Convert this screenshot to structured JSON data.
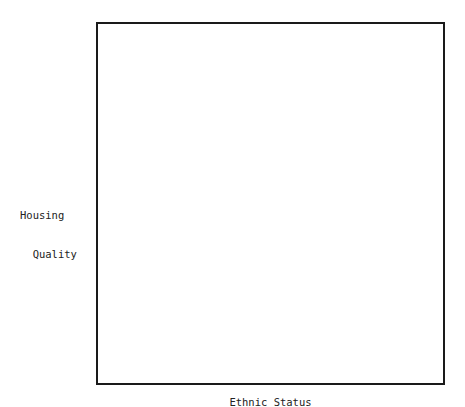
{
  "chart_data": {
    "type": "scatter",
    "title": "",
    "xlabel": "Ethnic Status",
    "ylabel": "Housing Quality",
    "ylabel_lines": [
      "Housing",
      "  Quality"
    ],
    "grid": false,
    "legend": null,
    "axis_ticks": false,
    "coordinate_space": "pixels relative to plot frame top-left (frame 349x363)",
    "points": [
      [
        36,
        29
      ],
      [
        43,
        40
      ],
      [
        79,
        40
      ],
      [
        57,
        53
      ],
      [
        102,
        53
      ],
      [
        101,
        59
      ],
      [
        143,
        55
      ],
      [
        181,
        46
      ],
      [
        225,
        49
      ],
      [
        208,
        53
      ],
      [
        258,
        41
      ],
      [
        290,
        45
      ],
      [
        292,
        44
      ],
      [
        325,
        52
      ],
      [
        305,
        56
      ],
      [
        339,
        43
      ],
      [
        321,
        71
      ],
      [
        282,
        71
      ],
      [
        225,
        71
      ],
      [
        190,
        82
      ],
      [
        167,
        63
      ],
      [
        156,
        74
      ],
      [
        148,
        85
      ],
      [
        119,
        66
      ],
      [
        127,
        80
      ],
      [
        101,
        88
      ],
      [
        62,
        71
      ],
      [
        51,
        88
      ],
      [
        34,
        89
      ],
      [
        70,
        82
      ],
      [
        71,
        90
      ],
      [
        86,
        96
      ],
      [
        100,
        88
      ],
      [
        99,
        102
      ],
      [
        115,
        90
      ],
      [
        132,
        120
      ],
      [
        158,
        93
      ],
      [
        174,
        89
      ],
      [
        178,
        88
      ],
      [
        185,
        81
      ],
      [
        200,
        88
      ],
      [
        211,
        86
      ],
      [
        198,
        106
      ],
      [
        186,
        103
      ],
      [
        187,
        114
      ],
      [
        203,
        116
      ],
      [
        198,
        122
      ],
      [
        185,
        96
      ],
      [
        191,
        105
      ],
      [
        176,
        115
      ],
      [
        180,
        128
      ],
      [
        233,
        108
      ],
      [
        235,
        121
      ],
      [
        231,
        117
      ],
      [
        248,
        122
      ],
      [
        243,
        103
      ],
      [
        298,
        99
      ],
      [
        304,
        96
      ],
      [
        300,
        102
      ],
      [
        282,
        132
      ],
      [
        270,
        142
      ],
      [
        267,
        103
      ],
      [
        282,
        113
      ],
      [
        281,
        126
      ],
      [
        216,
        142
      ],
      [
        232,
        146
      ],
      [
        241,
        144
      ],
      [
        205,
        149
      ],
      [
        152,
        134
      ],
      [
        142,
        116
      ],
      [
        131,
        104
      ],
      [
        135,
        142
      ],
      [
        105,
        133
      ],
      [
        125,
        123
      ],
      [
        99,
        141
      ],
      [
        124,
        147
      ],
      [
        101,
        158
      ],
      [
        117,
        165
      ],
      [
        119,
        172
      ],
      [
        116,
        169
      ],
      [
        92,
        173
      ],
      [
        99,
        169
      ],
      [
        89,
        181
      ],
      [
        110,
        180
      ],
      [
        120,
        182
      ],
      [
        133,
        188
      ],
      [
        131,
        188
      ],
      [
        136,
        192
      ],
      [
        157,
        213
      ],
      [
        151,
        196
      ],
      [
        154,
        212
      ],
      [
        134,
        203
      ],
      [
        155,
        223
      ],
      [
        124,
        222
      ],
      [
        106,
        220
      ],
      [
        107,
        225
      ],
      [
        111,
        226
      ],
      [
        93,
        232
      ],
      [
        95,
        245
      ],
      [
        90,
        244
      ],
      [
        79,
        232
      ],
      [
        67,
        224
      ],
      [
        47,
        231
      ],
      [
        43,
        207
      ],
      [
        54,
        212
      ],
      [
        58,
        224
      ],
      [
        55,
        199
      ],
      [
        40,
        196
      ],
      [
        24,
        215
      ],
      [
        29,
        239
      ],
      [
        42,
        251
      ],
      [
        37,
        248
      ],
      [
        32,
        257
      ],
      [
        36,
        256
      ],
      [
        22,
        270
      ],
      [
        24,
        266
      ],
      [
        49,
        258
      ],
      [
        56,
        256
      ],
      [
        70,
        266
      ],
      [
        73,
        278
      ],
      [
        68,
        285
      ],
      [
        69,
        292
      ],
      [
        64,
        295
      ],
      [
        59,
        302
      ],
      [
        51,
        311
      ],
      [
        24,
        318
      ],
      [
        23,
        330
      ],
      [
        19,
        306
      ],
      [
        27,
        320
      ],
      [
        25,
        334
      ],
      [
        45,
        319
      ],
      [
        43,
        324
      ],
      [
        26,
        339
      ],
      [
        32,
        342
      ],
      [
        42,
        341
      ],
      [
        54,
        337
      ],
      [
        68,
        333
      ],
      [
        90,
        337
      ],
      [
        101,
        323
      ],
      [
        116,
        318
      ],
      [
        124,
        318
      ],
      [
        128,
        322
      ],
      [
        150,
        303
      ],
      [
        124,
        305
      ],
      [
        137,
        313
      ],
      [
        176,
        311
      ],
      [
        168,
        318
      ],
      [
        207,
        320
      ],
      [
        176,
        333
      ],
      [
        198,
        341
      ],
      [
        192,
        343
      ],
      [
        189,
        338
      ],
      [
        224,
        327
      ],
      [
        248,
        324
      ],
      [
        263,
        334
      ],
      [
        259,
        330
      ],
      [
        265,
        330
      ],
      [
        277,
        322
      ],
      [
        277,
        334
      ],
      [
        270,
        349
      ],
      [
        282,
        336
      ],
      [
        300,
        348
      ],
      [
        310,
        348
      ],
      [
        313,
        345
      ],
      [
        318,
        353
      ],
      [
        325,
        364
      ],
      [
        327,
        365
      ]
    ]
  }
}
